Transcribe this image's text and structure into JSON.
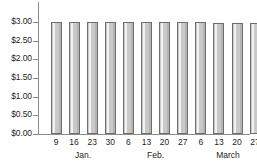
{
  "chart_data": {
    "type": "bar",
    "title": "",
    "subtitle": "",
    "xlabel": "",
    "ylabel": "",
    "grid": false,
    "legend": null,
    "ylim": [
      0,
      3.0
    ],
    "y_ticks": [
      0,
      0.5,
      1.0,
      1.5,
      2.0,
      2.5,
      3.0
    ],
    "y_tick_labels": [
      "$0.00",
      "$0.50",
      "$1.00",
      "$1.50",
      "$2.00",
      "$2.50",
      "$3.00"
    ],
    "categories": [
      "9",
      "16",
      "23",
      "30",
      "6",
      "13",
      "20",
      "27",
      "6",
      "13",
      "20",
      "27"
    ],
    "values": [
      3.0,
      3.0,
      3.0,
      3.0,
      3.0,
      2.99,
      2.99,
      2.99,
      2.99,
      2.98,
      2.98,
      2.98
    ],
    "groups": [
      {
        "label": "Jan.",
        "start_index": 0,
        "end_index": 3
      },
      {
        "label": "Feb.",
        "start_index": 4,
        "end_index": 7
      },
      {
        "label": "March",
        "start_index": 8,
        "end_index": 11
      }
    ],
    "bar_fill_color": "#c9c9c9",
    "bar_edge_color": "#6e6e6e",
    "axis_color": "#8c8c8c",
    "text_color": "#231f20"
  }
}
